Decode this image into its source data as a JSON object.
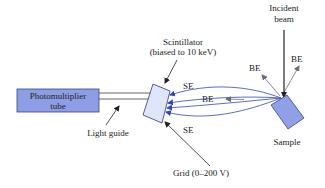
{
  "labels": {
    "pmt_line1": "Photomultiplier",
    "pmt_line2": "tube",
    "light_guide": "Light guide",
    "scintillator_line1": "Scintillator",
    "scintillator_line2": "(biased to 10 keV)",
    "grid": "Grid (0–200 V)",
    "incident_line1": "Incident",
    "incident_line2": "beam",
    "sample": "Sample",
    "se_top": "SE",
    "se_bottom": "SE",
    "be_mid": "BE",
    "be_left": "BE",
    "be_right": "BE"
  },
  "colors": {
    "pmt_fill": "#8d9ee6",
    "pmt_stroke": "#3a4580",
    "scintillator_fill": "#dfe6fb",
    "scintillator_stroke": "#333a55",
    "sample_fill": "#8fa0e6",
    "sample_stroke": "#3a4580",
    "electron_path": "#4a5bbf",
    "arrow_gray": "#7a7a88",
    "line_black": "#222222"
  }
}
